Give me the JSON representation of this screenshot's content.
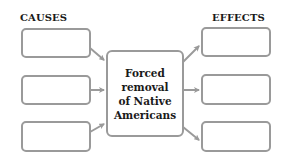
{
  "diagram": {
    "type": "cause-and-effect organizer",
    "headers": {
      "causes": "CAUSES",
      "effects": "EFFECTS"
    },
    "center": {
      "lines": [
        "Forced",
        "removal",
        "of Native",
        "Americans"
      ]
    },
    "causes": [
      {
        "text": ""
      },
      {
        "text": ""
      },
      {
        "text": ""
      }
    ],
    "effects": [
      {
        "text": ""
      },
      {
        "text": ""
      },
      {
        "text": ""
      }
    ],
    "colors": {
      "box_border": "#9a9a9a",
      "arrow": "#9a9a9a",
      "text": "#1a1a1a",
      "background": "#ffffff"
    }
  }
}
